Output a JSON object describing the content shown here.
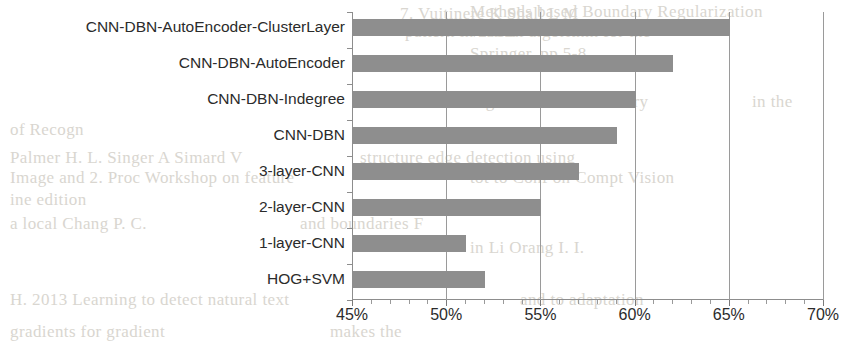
{
  "chart_data": {
    "type": "bar",
    "orientation": "horizontal",
    "title": "",
    "xlabel": "",
    "ylabel": "",
    "xlim": [
      45,
      70
    ],
    "xtick_labels": [
      "45%",
      "50%",
      "55%",
      "60%",
      "65%",
      "70%"
    ],
    "xticks": [
      45,
      50,
      55,
      60,
      65,
      70
    ],
    "xtick_minor_step": 1,
    "grid": "vertical",
    "legend": "none",
    "bar_color": "#8e8e8e",
    "categories": [
      "CNN-DBN-AutoEncoder-ClusterLayer",
      "CNN-DBN-AutoEncoder",
      "CNN-DBN-Indegree",
      "CNN-DBN",
      "3-layer-CNN",
      "2-layer-CNN",
      "1-layer-CNN",
      "HOG+SVM"
    ],
    "values": [
      65,
      62,
      60,
      59,
      57,
      55,
      51,
      52
    ],
    "value_labels": [
      "65%",
      "62%",
      "60%",
      "59%",
      "57%",
      "55%",
      "51%",
      "52%"
    ]
  },
  "bleed_text": [
    {
      "text": "Methods based Boundary Regularization",
      "x": 470,
      "y": 2
    },
    {
      "text": "7. Vuitinere  K  Shall   L  M",
      "x": 400,
      "y": 4
    },
    {
      "text": "vertical  algorithm  for  the",
      "x": 470,
      "y": 22
    },
    {
      "text": "pattern in 2012",
      "x": 405,
      "y": 22
    },
    {
      "text": "Springer, pp 5-8",
      "x": 470,
      "y": 44
    },
    {
      "text": "Learning to Provide Boundary",
      "x": 430,
      "y": 92
    },
    {
      "text": "in the",
      "x": 752,
      "y": 92
    },
    {
      "text": "of  Recogn",
      "x": 10,
      "y": 120
    },
    {
      "text": "Palmer H. L.  Singer  A  Simard  V",
      "x": 10,
      "y": 148
    },
    {
      "text": "structure  edge  detection  using",
      "x": 360,
      "y": 148
    },
    {
      "text": "Image and  2. Proc  Workshop on feature",
      "x": 10,
      "y": 168
    },
    {
      "text": "tot  to  Conf  on  Compt  Vision",
      "x": 470,
      "y": 168
    },
    {
      "text": "ine  edition",
      "x": 10,
      "y": 190
    },
    {
      "text": "a  local  Chang  P.  C.",
      "x": 10,
      "y": 214
    },
    {
      "text": "and boundaries  F",
      "x": 300,
      "y": 214
    },
    {
      "text": "in  Li  Orang  I.  I.",
      "x": 470,
      "y": 238
    },
    {
      "text": "H.  2013  Learning  to  detect  natural  text",
      "x": 10,
      "y": 290
    },
    {
      "text": "and to  adaptation",
      "x": 520,
      "y": 290
    },
    {
      "text": "gradients  for  gradient",
      "x": 10,
      "y": 322
    },
    {
      "text": "makes  the",
      "x": 330,
      "y": 322
    }
  ]
}
